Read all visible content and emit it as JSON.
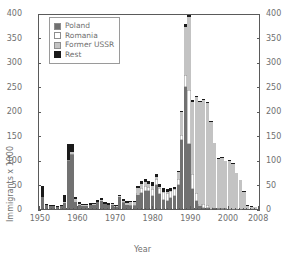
{
  "chart_data": {
    "type": "bar",
    "stacked": true,
    "title": "",
    "xlabel": "Year",
    "ylabel": "Immigrants x 1000",
    "ylim": [
      0,
      400
    ],
    "yticks": [
      0,
      50,
      100,
      150,
      200,
      250,
      300,
      350,
      400
    ],
    "ytick_labels": [
      "0",
      "50",
      "100",
      "150",
      "200",
      "250",
      "300",
      "350",
      "400"
    ],
    "dual_y_axis": true,
    "right_ytick_labels": [
      "0",
      "50",
      "100",
      "150",
      "200",
      "250",
      "300",
      "350",
      "400"
    ],
    "xlim": [
      1949.5,
      2008.5
    ],
    "xticks": [
      1950,
      1960,
      1970,
      1980,
      1990,
      2000,
      2008
    ],
    "xtick_labels": [
      "1950",
      "1960",
      "1970",
      "1980",
      "1990",
      "2000",
      "2008"
    ],
    "minor_xticks": true,
    "grid": false,
    "legend_position": "upper left",
    "legend_entries": [
      "Poland",
      "Romania",
      "Former USSR",
      "Rest"
    ],
    "series_colors": {
      "Poland": "#717171",
      "Romania": "#ffffff",
      "Former USSR": "#c3c3c3",
      "Rest": "#1a1a1a"
    },
    "x": [
      1950,
      1951,
      1952,
      1953,
      1954,
      1955,
      1956,
      1957,
      1958,
      1959,
      1960,
      1961,
      1962,
      1963,
      1964,
      1965,
      1966,
      1967,
      1968,
      1969,
      1970,
      1971,
      1972,
      1973,
      1974,
      1975,
      1976,
      1977,
      1978,
      1979,
      1980,
      1981,
      1982,
      1983,
      1984,
      1985,
      1986,
      1987,
      1988,
      1989,
      1990,
      1991,
      1992,
      1993,
      1994,
      1995,
      1996,
      1997,
      1998,
      1999,
      2000,
      2001,
      2002,
      2003,
      2004,
      2005,
      2006,
      2007,
      2008
    ],
    "series": [
      {
        "name": "Poland",
        "values": [
          25,
          8,
          6,
          6,
          5,
          6,
          12,
          98,
          110,
          14,
          8,
          7,
          7,
          8,
          9,
          14,
          17,
          10,
          8,
          9,
          5,
          25,
          13,
          8,
          7,
          7,
          29,
          32,
          36,
          36,
          26,
          50,
          30,
          19,
          17,
          22,
          27,
          48,
          140,
          250,
          133,
          40,
          17,
          6,
          3,
          2,
          1,
          2,
          1,
          1,
          1,
          1,
          1,
          1,
          1,
          0,
          0,
          0,
          0
        ]
      },
      {
        "name": "Romania",
        "values": [
          0,
          0,
          0,
          0,
          0,
          0,
          1,
          2,
          3,
          0,
          0,
          0,
          0,
          0,
          0,
          0,
          0,
          0,
          0,
          0,
          0,
          0,
          1,
          1,
          1,
          1,
          4,
          11,
          12,
          9,
          15,
          12,
          13,
          15,
          16,
          15,
          13,
          14,
          12,
          23,
          111,
          32,
          16,
          5,
          7,
          6,
          4,
          1,
          1,
          1,
          1,
          0,
          0,
          0,
          0,
          0,
          0,
          0,
          0
        ]
      },
      {
        "name": "Former USSR",
        "values": [
          0,
          0,
          0,
          0,
          0,
          0,
          1,
          1,
          4,
          6,
          3,
          1,
          1,
          1,
          1,
          1,
          1,
          1,
          1,
          1,
          1,
          1,
          3,
          4,
          6,
          6,
          9,
          9,
          8,
          7,
          7,
          4,
          2,
          1,
          1,
          0,
          1,
          14,
          47,
          98,
          148,
          147,
          195,
          207,
          213,
          209,
          172,
          131,
          101,
          103,
          95,
          98,
          91,
          72,
          58,
          35,
          7,
          5,
          4
        ]
      },
      {
        "name": "Rest",
        "values": [
          22,
          3,
          2,
          2,
          2,
          2,
          14,
          32,
          16,
          4,
          3,
          3,
          3,
          3,
          3,
          4,
          4,
          3,
          3,
          3,
          3,
          2,
          3,
          3,
          3,
          3,
          5,
          6,
          6,
          6,
          8,
          6,
          7,
          7,
          6,
          5,
          5,
          2,
          2,
          6,
          5,
          3,
          2,
          2,
          2,
          2,
          2,
          1,
          1,
          1,
          1,
          1,
          1,
          1,
          1,
          1,
          1,
          1,
          1
        ]
      }
    ]
  }
}
